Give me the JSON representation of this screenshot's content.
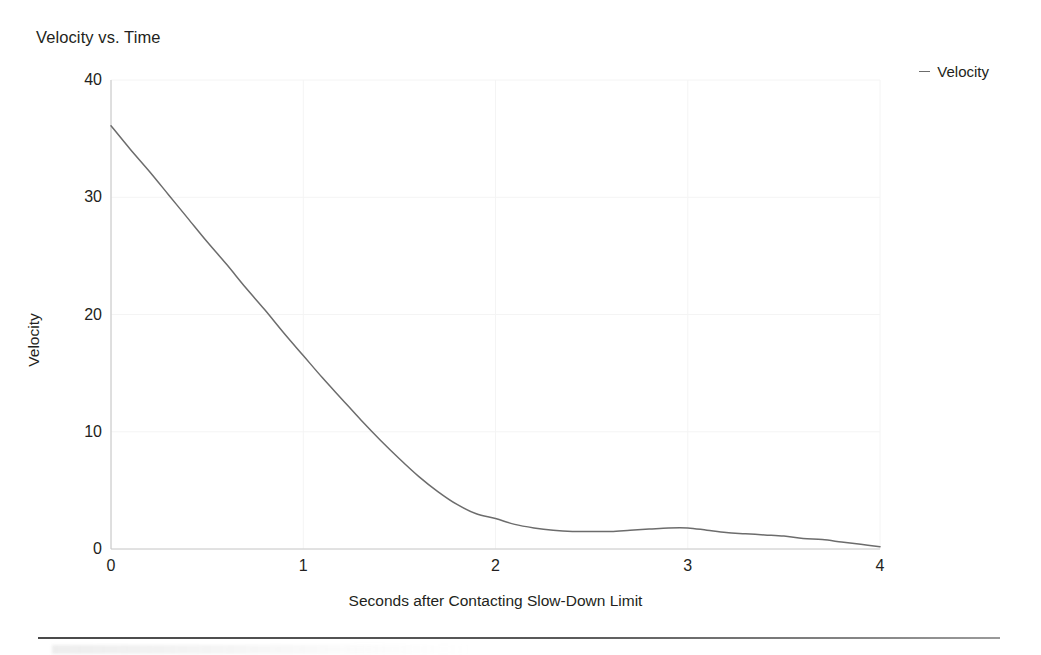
{
  "chart_data": {
    "type": "line",
    "title": "Velocity vs. Time",
    "xlabel": "Seconds after Contacting Slow-Down Limit",
    "ylabel": "Velocity",
    "xlim": [
      0,
      4
    ],
    "ylim": [
      0,
      40
    ],
    "xticks": [
      "0",
      "1",
      "2",
      "3",
      "4"
    ],
    "xtick_values": [
      0,
      1,
      2,
      3,
      4
    ],
    "yticks": [
      "0",
      "10",
      "20",
      "30",
      "40"
    ],
    "ytick_values": [
      0,
      10,
      20,
      30,
      40
    ],
    "grid": true,
    "grid_color": "#f4f4f4",
    "legend": {
      "position": "top-right",
      "entries": [
        {
          "label": "Velocity",
          "marker": "dash",
          "color": "#6c6c6c"
        }
      ]
    },
    "series": [
      {
        "name": "Velocity",
        "color": "#6c6c6c",
        "line_width": 1.5,
        "x": [
          0,
          0.1,
          0.2,
          0.3,
          0.4,
          0.5,
          0.6,
          0.7,
          0.8,
          0.9,
          1.0,
          1.1,
          1.2,
          1.3,
          1.4,
          1.5,
          1.6,
          1.7,
          1.8,
          1.9,
          2.0,
          2.1,
          2.2,
          2.3,
          2.4,
          2.5,
          2.6,
          2.7,
          2.8,
          2.9,
          3.0,
          3.1,
          3.2,
          3.3,
          3.4,
          3.5,
          3.6,
          3.7,
          3.8,
          3.9,
          4.0
        ],
        "y": [
          36.1,
          34.1,
          32.2,
          30.2,
          28.2,
          26.2,
          24.3,
          22.3,
          20.4,
          18.4,
          16.5,
          14.6,
          12.8,
          11.0,
          9.3,
          7.7,
          6.2,
          4.9,
          3.8,
          3.0,
          2.6,
          2.1,
          1.8,
          1.6,
          1.5,
          1.5,
          1.5,
          1.6,
          1.7,
          1.8,
          1.8,
          1.6,
          1.4,
          1.3,
          1.2,
          1.1,
          0.9,
          0.8,
          0.6,
          0.4,
          0.2
        ]
      }
    ],
    "annotations": []
  },
  "figure": {
    "background": "#ffffff",
    "axis_color": "#c9c9c9",
    "text_color": "#231f20",
    "divider_color": "#4a4a4a"
  }
}
